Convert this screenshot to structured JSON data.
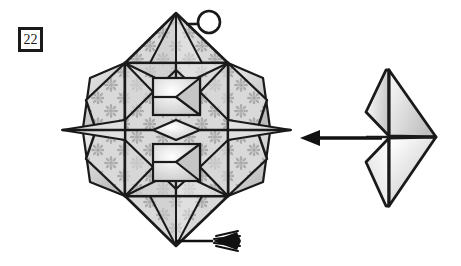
{
  "page": {
    "background_color": "#ffffff",
    "width": 461,
    "height": 266,
    "kind": "origami-instruction-diagram"
  },
  "step": {
    "number": "22",
    "badge_border_color": "#1a1a1a",
    "badge_fill_color": "#ffffff"
  },
  "palette": {
    "outline": "#1a1a1a",
    "paper_patterned_fill": "#d9d9d9",
    "paper_motif": "#b0b0b0",
    "paper_plain_light": "#f2f2f2",
    "paper_plain_mid": "#cfcfcf",
    "paper_shadow": "#bdbdbd",
    "arrow_color": "#111111",
    "circle_stroke": "#1a1a1a"
  },
  "figures": {
    "left_model": {
      "name": "folded-star-model",
      "description": "Completed patterned origami star/box model seen face on, vertically symmetric, with side points and a nested square-in-square pleat pattern",
      "pattern": "flower-snowflake-motif",
      "has_top_point": true,
      "has_bottom_point": true,
      "has_left_spike": true,
      "has_right_spike": true
    },
    "right_model": {
      "name": "folded-chevron-model",
      "description": "Same model viewed edge on, collapsed into a chevron of four gradient-shaded panels",
      "panel_count": 4,
      "shading": "white-to-gray-gradient"
    }
  },
  "annotations": {
    "detail_circle": {
      "name": "detail-circle",
      "label": "",
      "radius": 11
    },
    "transform_arrow": {
      "name": "transform-arrow",
      "direction": "left",
      "meaning": "result-of-fold"
    },
    "tassel": {
      "name": "tassel-decoration",
      "position": "bottom-point"
    }
  }
}
